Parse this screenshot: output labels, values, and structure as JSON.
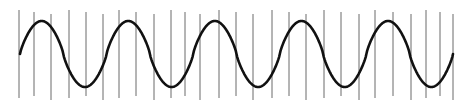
{
  "diagram": {
    "title": "",
    "wave": {
      "cycles": 5,
      "x_start": 20,
      "x_end": 453,
      "center_y": 54,
      "amplitude": 33,
      "phase": "starts at midline rising",
      "stroke_color": "#111111",
      "stroke_width": 2.6
    },
    "sample_lines": {
      "count": 27,
      "x_positions": [
        19,
        34,
        51,
        69,
        86,
        103,
        119,
        136,
        154,
        171,
        185,
        200,
        219,
        236,
        253,
        272,
        289,
        306,
        324,
        341,
        359,
        375,
        393,
        411,
        426,
        440,
        453
      ],
      "y_top": 10,
      "y_bottom": 100,
      "color": "#6b6b6b",
      "stroke_width": 1
    }
  }
}
